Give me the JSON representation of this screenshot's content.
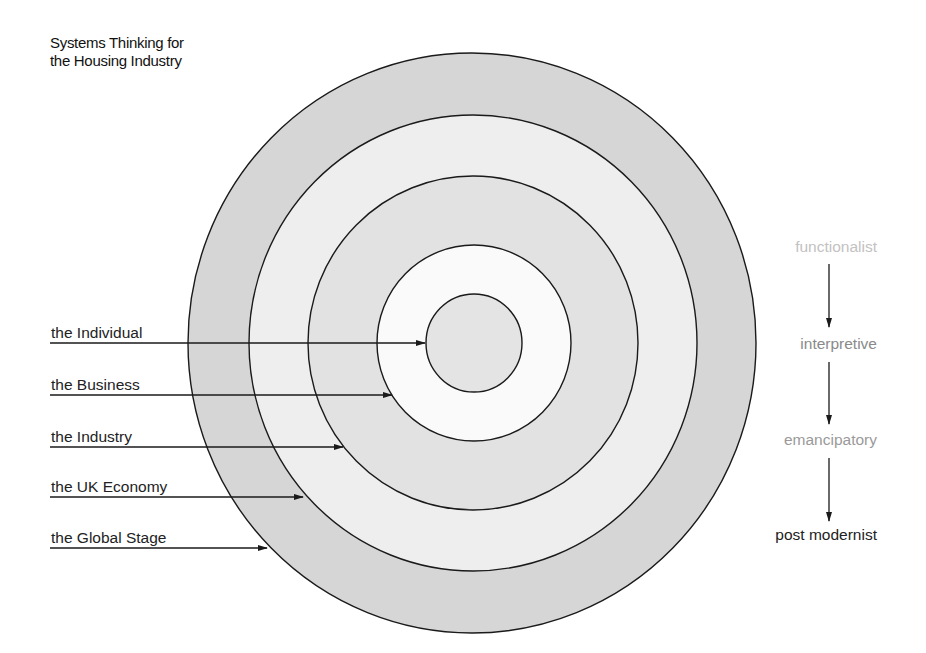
{
  "title": {
    "line1": "Systems Thinking for",
    "line2": "the Housing Industry"
  },
  "levels": [
    {
      "label": "the Individual"
    },
    {
      "label": "the Business"
    },
    {
      "label": "the Industry"
    },
    {
      "label": "the UK Economy"
    },
    {
      "label": "the Global Stage"
    }
  ],
  "paradigms": [
    {
      "label": "functionalist",
      "color": "#c2c2c2"
    },
    {
      "label": "interpretive",
      "color": "#8a8a8a"
    },
    {
      "label": "emancipatory",
      "color": "#9a9a9a"
    },
    {
      "label": "post modernist",
      "color": "#222222"
    }
  ],
  "colors": {
    "ring_dark": "#d6d6d6",
    "ring_light": "#eeeeee",
    "ring_white": "#fafafa",
    "stroke": "#1a1a1a"
  }
}
